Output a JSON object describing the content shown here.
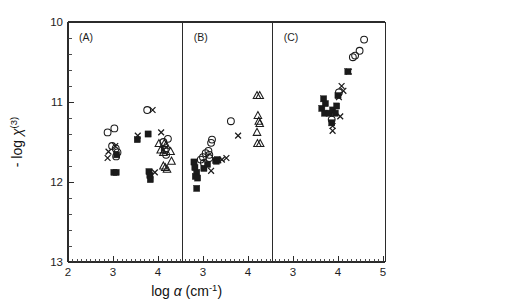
{
  "figure": {
    "background": "#ffffff",
    "ink_color": "#1a1a1a",
    "axis_title_x": "log",
    "axis_title_x_symbol": "α",
    "axis_title_x_units": "(cm",
    "axis_title_x_units_sup": "-1",
    "axis_title_x_units_close": ")",
    "axis_title_y_prefix": "- log",
    "axis_title_y_symbol": "χ",
    "axis_title_y_sup": "(3)"
  },
  "chart_data": {
    "type": "scatter",
    "title": "",
    "xlabel": "log α (cm-1)",
    "ylabel": "- log χ(3)",
    "grid": false,
    "legend": "none",
    "y_inverted": true,
    "ylim": [
      10,
      13
    ],
    "yticks": [
      10,
      11,
      12,
      13
    ],
    "yticklabels": [
      "10",
      "11",
      "12",
      "13"
    ],
    "y_minor_interval": 0.2,
    "panels": [
      {
        "label": "(A)",
        "xlim": [
          2,
          4.55
        ],
        "xticks": [
          2,
          3,
          4
        ],
        "xticklabels": [
          "2",
          "3",
          "4"
        ],
        "x_minor_interval": 0.1,
        "series": [
          {
            "name": "open-circle",
            "marker": "circle-open",
            "points": [
              [
                2.88,
                11.38
              ],
              [
                3.03,
                11.33
              ],
              [
                2.98,
                11.55
              ],
              [
                3.06,
                11.58
              ],
              [
                3.1,
                11.63
              ],
              [
                3.07,
                11.68
              ],
              [
                3.76,
                11.1
              ],
              [
                4.12,
                11.5
              ],
              [
                4.22,
                11.46
              ],
              [
                4.15,
                11.6
              ],
              [
                4.18,
                11.66
              ]
            ]
          },
          {
            "name": "filled-square",
            "marker": "square-filled",
            "points": [
              [
                3.08,
                11.66
              ],
              [
                3.02,
                11.88
              ],
              [
                3.07,
                11.88
              ],
              [
                3.54,
                11.47
              ],
              [
                3.78,
                11.4
              ],
              [
                3.8,
                11.87
              ],
              [
                3.82,
                11.92
              ],
              [
                3.83,
                11.97
              ]
            ]
          },
          {
            "name": "open-triangle",
            "marker": "triangle-open",
            "points": [
              [
                4.02,
                11.52
              ],
              [
                4.06,
                11.6
              ],
              [
                4.12,
                11.63
              ],
              [
                4.14,
                11.52
              ],
              [
                4.18,
                11.54
              ],
              [
                4.28,
                11.62
              ],
              [
                4.12,
                11.8
              ],
              [
                4.16,
                11.82
              ],
              [
                4.2,
                11.84
              ],
              [
                4.3,
                11.74
              ]
            ]
          },
          {
            "name": "cross",
            "marker": "cross",
            "points": [
              [
                2.9,
                11.62
              ],
              [
                2.88,
                11.7
              ],
              [
                3.05,
                11.55
              ],
              [
                3.55,
                11.42
              ],
              [
                3.88,
                11.1
              ],
              [
                4.07,
                11.38
              ],
              [
                4.12,
                11.6
              ],
              [
                3.93,
                11.88
              ]
            ]
          }
        ]
      },
      {
        "label": "(B)",
        "xlim": [
          2.55,
          4.55
        ],
        "xticks": [
          3,
          4
        ],
        "xticklabels": [
          "3",
          "4"
        ],
        "x_minor_interval": 0.1,
        "series": [
          {
            "name": "open-circle",
            "marker": "circle-open",
            "points": [
              [
                2.95,
                11.72
              ],
              [
                3.0,
                11.69
              ],
              [
                3.02,
                11.76
              ],
              [
                3.06,
                11.64
              ],
              [
                3.12,
                11.61
              ],
              [
                3.14,
                11.66
              ],
              [
                3.14,
                11.7
              ],
              [
                3.18,
                11.51
              ],
              [
                3.2,
                11.47
              ],
              [
                3.62,
                11.24
              ]
            ]
          },
          {
            "name": "filled-square",
            "marker": "square-filled",
            "points": [
              [
                2.8,
                11.75
              ],
              [
                2.82,
                11.82
              ],
              [
                2.86,
                11.88
              ],
              [
                2.83,
                11.93
              ],
              [
                2.88,
                11.95
              ],
              [
                2.86,
                12.08
              ],
              [
                3.02,
                11.83
              ],
              [
                3.1,
                11.78
              ],
              [
                3.28,
                11.73
              ],
              [
                3.3,
                11.74
              ],
              [
                3.32,
                11.72
              ]
            ]
          },
          {
            "name": "open-triangle",
            "marker": "triangle-open",
            "points": [
              [
                4.2,
                10.92
              ],
              [
                4.26,
                10.92
              ],
              [
                4.22,
                11.17
              ],
              [
                4.24,
                11.24
              ],
              [
                4.26,
                11.27
              ],
              [
                4.2,
                11.38
              ],
              [
                4.21,
                11.52
              ],
              [
                4.27,
                11.52
              ]
            ]
          },
          {
            "name": "cross",
            "marker": "cross",
            "points": [
              [
                3.18,
                11.86
              ],
              [
                3.34,
                11.73
              ],
              [
                3.42,
                11.72
              ],
              [
                3.52,
                11.7
              ],
              [
                3.78,
                11.42
              ]
            ]
          }
        ]
      },
      {
        "label": "(C)",
        "xlim": [
          2.55,
          5.05
        ],
        "xticks": [
          3,
          4,
          5
        ],
        "xticklabels": [
          "3",
          "4",
          "5"
        ],
        "x_minor_interval": 0.1,
        "series": [
          {
            "name": "open-circle",
            "marker": "circle-open",
            "points": [
              [
                4.58,
                10.22
              ],
              [
                4.48,
                10.36
              ],
              [
                4.38,
                10.42
              ],
              [
                4.33,
                10.44
              ],
              [
                4.02,
                10.88
              ],
              [
                3.86,
                11.22
              ]
            ]
          },
          {
            "name": "filled-square",
            "marker": "square-filled",
            "points": [
              [
                3.68,
                10.96
              ],
              [
                3.72,
                11.02
              ],
              [
                3.64,
                11.08
              ],
              [
                3.7,
                11.14
              ],
              [
                3.8,
                11.14
              ],
              [
                3.88,
                11.1
              ],
              [
                3.94,
                11.14
              ],
              [
                3.97,
                11.05
              ],
              [
                4.0,
                10.92
              ],
              [
                3.86,
                11.26
              ],
              [
                4.22,
                10.62
              ]
            ]
          },
          {
            "name": "cross",
            "marker": "cross",
            "points": [
              [
                4.24,
                10.62
              ],
              [
                4.08,
                10.8
              ],
              [
                4.02,
                10.94
              ],
              [
                4.05,
                11.18
              ],
              [
                3.88,
                11.3
              ],
              [
                3.88,
                11.36
              ],
              [
                4.12,
                10.86
              ]
            ]
          }
        ]
      }
    ]
  }
}
